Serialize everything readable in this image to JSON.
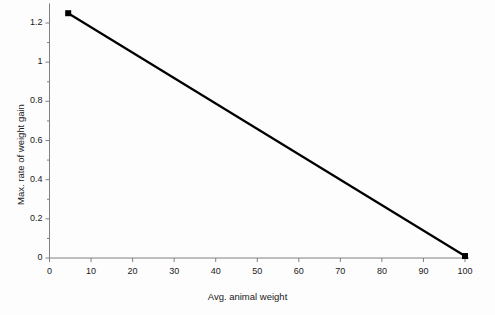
{
  "chart_data": {
    "type": "line",
    "title": "",
    "subtitle": "",
    "xlabel": "Avg. animal weight",
    "ylabel": "Max. rate of weight gain",
    "xlim": [
      0,
      100
    ],
    "ylim": [
      0,
      1.3
    ],
    "grid": false,
    "legend": "none",
    "x_ticks": [
      0,
      10,
      20,
      30,
      40,
      50,
      60,
      70,
      80,
      90,
      100
    ],
    "x_tick_labels": [
      "0",
      "10",
      "20",
      "30",
      "40",
      "50",
      "60",
      "70",
      "80",
      "90",
      "100"
    ],
    "y_ticks": [
      0,
      0.2,
      0.4,
      0.6,
      0.8,
      1,
      1.2
    ],
    "y_tick_labels": [
      "0",
      "0.2",
      "0.4",
      "0.6",
      "0.8",
      "1",
      "1.2"
    ],
    "series": [
      {
        "name": "Max. rate of weight gain",
        "color": "#000000",
        "marker": "square",
        "line_width": 2.2,
        "x": [
          4.5,
          100
        ],
        "values": [
          1.25,
          0.01
        ]
      }
    ],
    "annotations": []
  },
  "style": {
    "background_color": "#fdfdfd",
    "axis_color": "#808080",
    "line_color": "#000000",
    "text_color": "#1a1a1a"
  }
}
